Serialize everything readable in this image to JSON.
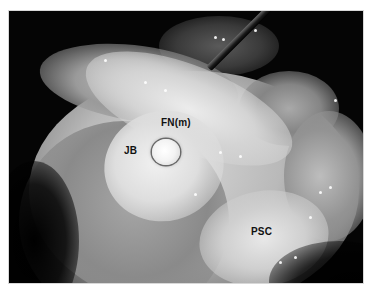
{
  "figure": {
    "type": "intraoperative surgical photograph (grayscale)",
    "labels": {
      "facial_nerve": "FN(m)",
      "jugular_bulb": "JB",
      "posterior_semicircular_canal": "PSC"
    }
  }
}
